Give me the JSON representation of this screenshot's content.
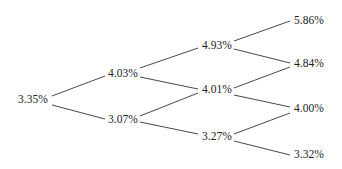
{
  "line_color": "#333333",
  "nodes": {
    "t0": [
      "3.35%"
    ],
    "t1": [
      "4.03%",
      "3.07%"
    ],
    "t2": [
      "4.93%",
      "4.01%",
      "3.27%"
    ],
    "t3": [
      "5.86%",
      "4.84%",
      "4.00%",
      "3.32%"
    ]
  }
}
